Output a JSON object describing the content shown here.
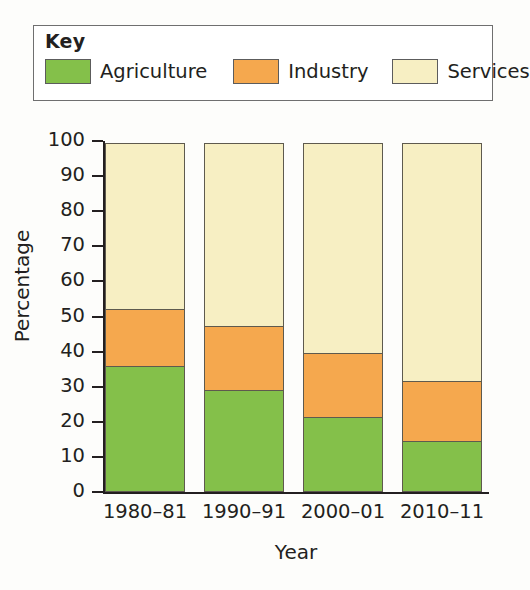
{
  "legend": {
    "title": "Key",
    "items": [
      {
        "label": "Agriculture",
        "color": "#84c04a",
        "icon": "legend-swatch-agriculture"
      },
      {
        "label": "Industry",
        "color": "#f5a84e",
        "icon": "legend-swatch-industry"
      },
      {
        "label": "Services",
        "color": "#f7efc3",
        "icon": "legend-swatch-services"
      }
    ]
  },
  "axes": {
    "ylabel": "Percentage",
    "xlabel": "Year",
    "yticks": [
      "0",
      "10",
      "20",
      "30",
      "40",
      "50",
      "60",
      "70",
      "80",
      "90",
      "100"
    ]
  },
  "chart_data": {
    "type": "bar",
    "title": "",
    "subtitle": "",
    "stacked": true,
    "stack_total": 100,
    "categories": [
      "1980–81",
      "1990–91",
      "2000–01",
      "2010–11"
    ],
    "series": [
      {
        "name": "Agriculture",
        "color": "#84c04a",
        "values": [
          36,
          29,
          21.5,
          14.5
        ]
      },
      {
        "name": "Industry",
        "color": "#f5a84e",
        "values": [
          16.5,
          18.5,
          18.5,
          17.5
        ]
      },
      {
        "name": "Services",
        "color": "#f7efc3",
        "values": [
          47.5,
          52.5,
          60,
          68
        ]
      }
    ],
    "cumulative_tops": {
      "Agriculture": [
        36,
        29,
        21.5,
        14.5
      ],
      "Industry": [
        52.5,
        47.5,
        40,
        32
      ],
      "Services": [
        100,
        100,
        100,
        100
      ]
    },
    "xlabel": "Year",
    "ylabel": "Percentage",
    "ylim": [
      0,
      100
    ],
    "ytick_step": 10,
    "grid": false,
    "legend_position": "top"
  }
}
